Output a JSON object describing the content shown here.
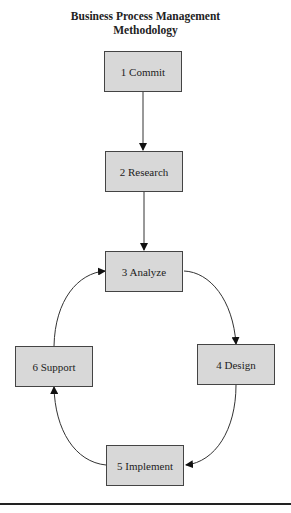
{
  "diagram": {
    "title_line1": "Business Process Management",
    "title_line2": "Methodology",
    "nodes": [
      {
        "id": "commit",
        "label": "1 Commit"
      },
      {
        "id": "research",
        "label": "2 Research"
      },
      {
        "id": "analyze",
        "label": "3 Analyze"
      },
      {
        "id": "design",
        "label": "4 Design"
      },
      {
        "id": "implement",
        "label": "5 Implement"
      },
      {
        "id": "support",
        "label": "6 Support"
      }
    ],
    "edges": [
      {
        "from": "commit",
        "to": "research"
      },
      {
        "from": "research",
        "to": "analyze"
      },
      {
        "from": "analyze",
        "to": "design"
      },
      {
        "from": "design",
        "to": "implement"
      },
      {
        "from": "implement",
        "to": "support"
      },
      {
        "from": "support",
        "to": "analyze"
      }
    ],
    "colors": {
      "box_fill": "#d8d8d8",
      "box_border": "#444444",
      "line": "#222222"
    }
  }
}
